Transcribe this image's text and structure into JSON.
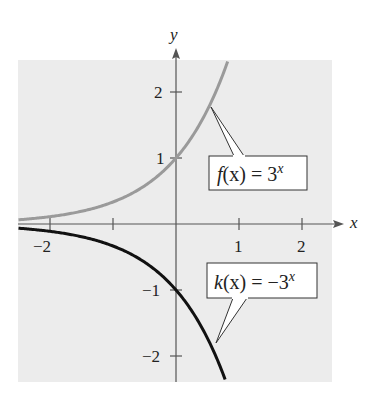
{
  "chart_data": {
    "type": "line",
    "title": "",
    "xlabel": "x",
    "ylabel": "y",
    "xlim": [
      -2.5,
      2.5
    ],
    "ylim": [
      -2.4,
      2.5
    ],
    "grid": false,
    "x_ticks": [
      -2,
      -1,
      1,
      2
    ],
    "x_tick_labels": [
      "−2",
      "",
      "1",
      "2"
    ],
    "y_ticks": [
      -2,
      -1,
      1,
      2
    ],
    "y_tick_labels": [
      "−2",
      "−1",
      "1",
      "2"
    ],
    "series": [
      {
        "name": "f(x) = 3^x",
        "color": "#9a9a9a",
        "x": [
          -2.5,
          -2,
          -1.5,
          -1,
          -0.5,
          0,
          0.25,
          0.5,
          0.75,
          0.83
        ],
        "y": [
          0.064,
          0.111,
          0.192,
          0.333,
          0.577,
          1,
          1.316,
          1.732,
          2.28,
          2.48
        ]
      },
      {
        "name": "k(x) = −3^x",
        "color": "#111111",
        "x": [
          -2.5,
          -2,
          -1.5,
          -1,
          -0.5,
          0,
          0.25,
          0.5,
          0.75,
          0.79
        ],
        "y": [
          -0.064,
          -0.111,
          -0.192,
          -0.333,
          -0.577,
          -1,
          -1.316,
          -1.732,
          -2.28,
          -2.39
        ]
      }
    ],
    "annotations": [
      {
        "text_fn": "f",
        "text_arg": "(x) = 3",
        "text_sup": "x",
        "points_to": [
          0.55,
          1.83
        ]
      },
      {
        "text_fn": "k",
        "text_arg": "(x) = −3",
        "text_sup": "x",
        "points_to": [
          0.64,
          -1.8
        ]
      }
    ]
  },
  "axes": {
    "x_label": "x",
    "y_label": "y",
    "tick_neg2_x": "−2",
    "tick_1_x": "1",
    "tick_2_x": "2",
    "tick_2_y": "2",
    "tick_1_y": "1",
    "tick_neg1_y": "−1",
    "tick_neg2_y": "−2"
  },
  "labels": {
    "f": {
      "fn": "f",
      "args": "(x) = 3",
      "sup": "x"
    },
    "k": {
      "fn": "k",
      "args": "(x) = −3",
      "sup": "x"
    }
  },
  "colors": {
    "background": "#ececec",
    "f_curve": "#9a9a9a",
    "k_curve": "#111111",
    "axis": "#555555"
  }
}
